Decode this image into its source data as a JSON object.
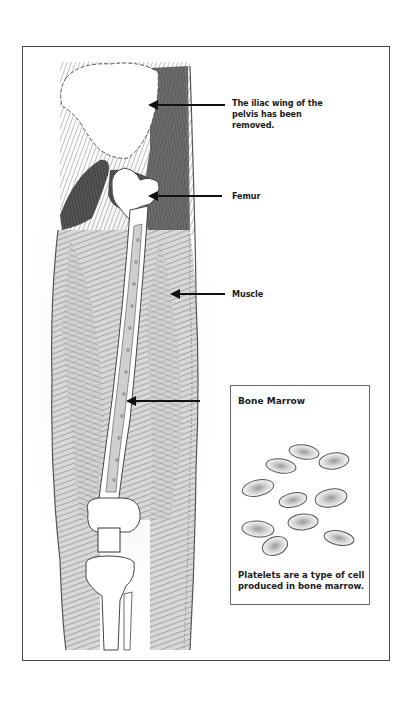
{
  "figure": {
    "labels": {
      "iliac_wing": "The iliac wing of the pelvis has been removed.",
      "femur": "Femur",
      "muscle": "Muscle",
      "bone_marrow_arrow_target": "Bone Marrow"
    },
    "inset": {
      "title": "Bone Marrow",
      "caption": "Platelets are a type of cell produced in bone marrow.",
      "cell_count": 10
    },
    "colors": {
      "ink": "#1a1a1a",
      "frame": "#444444",
      "shading": "#8a8a8a",
      "background": "#ffffff"
    }
  }
}
